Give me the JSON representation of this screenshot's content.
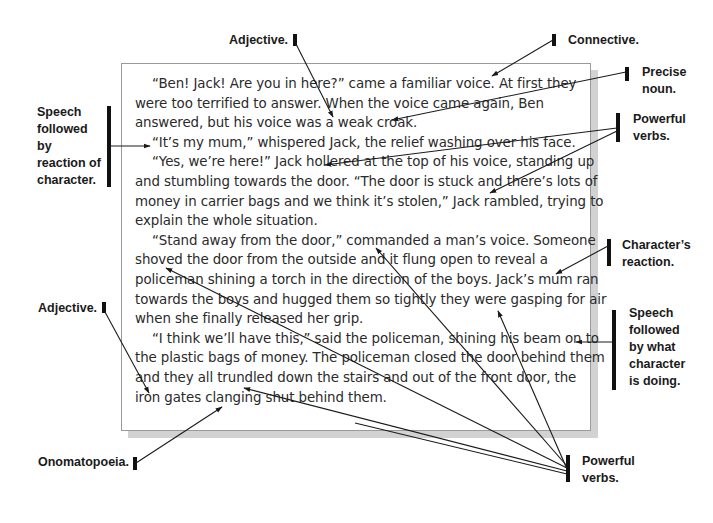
{
  "story": {
    "lines": [
      {
        "text": "“Ben! Jack! Are you in here?” came a familiar voice. At first they",
        "indent": true
      },
      {
        "text": "were too terrified to answer. When the voice came again, Ben",
        "indent": false
      },
      {
        "text": "answered, but his voice was a weak croak.",
        "indent": false
      },
      {
        "text": "“It’s my mum,” whispered Jack, the relief washing over his face.",
        "indent": true
      },
      {
        "text": "“Yes, we’re here!” Jack hollered at the top of his voice, standing up",
        "indent": true
      },
      {
        "text": "and stumbling towards the door. “The door is stuck and there’s lots of",
        "indent": false
      },
      {
        "text": "money in carrier bags and we think it’s stolen,” Jack rambled, trying to",
        "indent": false
      },
      {
        "text": "explain the whole situation.",
        "indent": false
      },
      {
        "text": "“Stand away from the door,” commanded a man’s voice. Someone",
        "indent": true
      },
      {
        "text": "shoved the door from the outside and it flung open to reveal a",
        "indent": false
      },
      {
        "text": "policeman shining a torch in the direction of the boys. Jack’s mum ran",
        "indent": false
      },
      {
        "text": "towards the boys and hugged them so tightly they were gasping for air",
        "indent": false
      },
      {
        "text": "when she finally released her grip.",
        "indent": false
      },
      {
        "text": "“I think we’ll have this,” said the policeman, shining his beam on to",
        "indent": true
      },
      {
        "text": "the plastic bags of money. The policeman closed the door behind them",
        "indent": false
      },
      {
        "text": "and they all trundled down the stairs and out of the front door, the",
        "indent": false
      },
      {
        "text": "iron gates clanging shut behind them.",
        "indent": false
      }
    ]
  },
  "annotations": {
    "adjective_top": [
      "Adjective."
    ],
    "connective": [
      "Connective."
    ],
    "precise_noun": [
      "Precise",
      "noun."
    ],
    "powerful_verbs_top": [
      "Powerful",
      "verbs."
    ],
    "speech_reaction": [
      "Speech",
      "followed",
      "by",
      "reaction of",
      "character."
    ],
    "characters_reaction": [
      "Character’s",
      "reaction."
    ],
    "adjective_left": [
      "Adjective."
    ],
    "speech_doing": [
      "Speech",
      "followed",
      "by what",
      "character",
      "is doing."
    ],
    "onomatopoeia": [
      "Onomatopoeia."
    ],
    "powerful_verbs_bottom": [
      "Powerful",
      "verbs."
    ]
  },
  "colors": {
    "text": "#2a2a2a",
    "label": "#1a1a1a",
    "border": "#9a9a9a",
    "shadow": "#d2d2d2",
    "arrow": "#1a1a1a"
  }
}
